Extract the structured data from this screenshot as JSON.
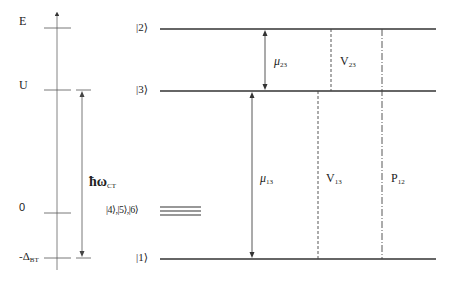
{
  "diagram": {
    "type": "energy-level-diagram",
    "energy_axis": {
      "ticks": [
        {
          "label": "E",
          "sub": ""
        },
        {
          "label": "U",
          "sub": ""
        },
        {
          "label": "0",
          "sub": ""
        },
        {
          "label": "-Δ",
          "sub": "BT"
        }
      ],
      "transfer_label": {
        "main": "ħω",
        "sub": "CT"
      }
    },
    "levels": [
      {
        "label": "|2⟩"
      },
      {
        "label": "|3⟩"
      },
      {
        "label": "|4⟩,|5⟩,|6⟩"
      },
      {
        "label": "|1⟩"
      }
    ],
    "transitions": [
      {
        "label": "μ",
        "sub": "23",
        "style": "solid-double-arrow"
      },
      {
        "label": "V",
        "sub": "23",
        "style": "dashed"
      },
      {
        "label": "μ",
        "sub": "13",
        "style": "solid-double-arrow"
      },
      {
        "label": "V",
        "sub": "13",
        "style": "dashed"
      },
      {
        "label": "P",
        "sub": "12",
        "style": "dash-dot"
      }
    ]
  }
}
